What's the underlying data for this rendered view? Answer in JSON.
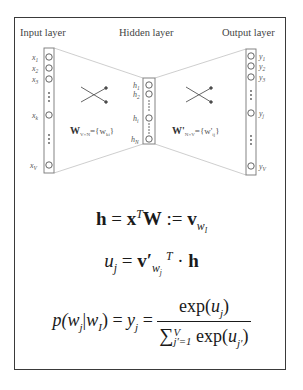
{
  "diagram": {
    "input_layer": {
      "title": "Input layer",
      "nodes": [
        "x_1",
        "x_2",
        "x_3",
        "x_k",
        "x_V"
      ]
    },
    "hidden_layer": {
      "title": "Hidden layer",
      "nodes": [
        "h_1",
        "h_2",
        "h_i",
        "h_N"
      ]
    },
    "output_layer": {
      "title": "Output layer",
      "nodes": [
        "y_1",
        "y_2",
        "y_3",
        "y_j",
        "y_V"
      ]
    },
    "weights_input_hidden": "W_{V×N} = {w_ki}",
    "weights_hidden_output": "W'_{N×V} = {w'_ij}"
  },
  "labels": {
    "x1": "x",
    "x1s": "1",
    "x2": "x",
    "x2s": "2",
    "x3": "x",
    "x3s": "3",
    "xk": "x",
    "xks": "k",
    "xV": "x",
    "xVs": "V",
    "h1": "h",
    "h1s": "1",
    "h2": "h",
    "h2s": "2",
    "hi": "h",
    "his": "i",
    "hN": "h",
    "hNs": "N",
    "y1": "y",
    "y1s": "1",
    "y2": "y",
    "y2s": "2",
    "y3": "y",
    "y3s": "3",
    "yj": "y",
    "yjs": "j",
    "yV": "y",
    "yVs": "V",
    "W": "W",
    "Wsub": "V×N",
    "Weq": "={w",
    "Wki": "ki",
    "Wend": "}",
    "Wp": "W'",
    "Wpsub": "N×V",
    "Wpeq": "={w'",
    "Wpij": "ij",
    "Wpend": "}"
  },
  "equations": {
    "eq1": {
      "text": "h = x^T W := v_{w_I}",
      "h": "h",
      "eq": " = ",
      "x": "x",
      "T": "T",
      "W": "W",
      "def": " := ",
      "v": "v",
      "w": "w",
      "I": "I"
    },
    "eq2": {
      "text": "u_j = v'_{w_j}^T · h",
      "u": "u",
      "j": "j",
      "eq": " = ",
      "v": "v′",
      "w": "w",
      "wj": "j",
      "T": "T",
      "dot": " · ",
      "h": "h"
    },
    "eq3": {
      "text": "p(w_j|w_I) = y_j = exp(u_j) / Σ_{j'=1}^{V} exp(u_{j'})",
      "lhs_p": "p(",
      "lhs_w": "w",
      "lhs_j": "j",
      "lhs_bar": "|",
      "lhs_w2": "w",
      "lhs_I": "I",
      "lhs_close": ")",
      "eq": " = ",
      "y": "y",
      "yj": "j",
      "eq2": " = ",
      "num_exp": "exp(",
      "num_u": "u",
      "num_j": "j",
      "num_close": ")",
      "sum": "∑",
      "sum_lower": "j′=1",
      "sum_upper": "V",
      "den_exp": " exp(",
      "den_u": "u",
      "den_j": "j′",
      "den_close": ")"
    }
  },
  "colors": {
    "frame": "#3a3a3a",
    "lines": "#b8b8b8",
    "node": "#666666"
  }
}
